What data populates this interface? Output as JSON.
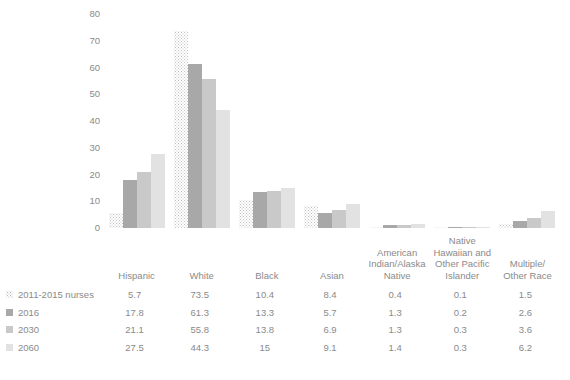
{
  "chart_data": {
    "type": "bar",
    "title": "",
    "xlabel": "",
    "ylabel": "",
    "ylim": [
      0,
      80
    ],
    "yticks": [
      0,
      10,
      20,
      30,
      40,
      50,
      60,
      70,
      80
    ],
    "grid": false,
    "legend_position": "bottom-left-table",
    "categories": [
      "Hispanic",
      "White",
      "Black",
      "Asian",
      "American Indian/Alaska Native",
      "Native Hawaiian and Other Pacific Islander",
      "Multiple/Other Race"
    ],
    "category_label_lines": [
      [
        "Hispanic"
      ],
      [
        "White"
      ],
      [
        "Black"
      ],
      [
        "Asian"
      ],
      [
        "American",
        "Indian/Alaska",
        "Native"
      ],
      [
        "Native",
        "Hawaiian and",
        "Other Pacific",
        "Islander"
      ],
      [
        "Multiple/",
        "Other Race"
      ]
    ],
    "series": [
      {
        "name": "2011-2015 nurses",
        "style": "dotted",
        "color": "#ffffff",
        "values": [
          5.7,
          73.5,
          10.4,
          8.4,
          0.4,
          0.1,
          1.5
        ],
        "value_labels": [
          "5.7",
          "73.5",
          "10.4",
          "8.4",
          "0.4",
          "0.1",
          "1.5"
        ]
      },
      {
        "name": "2016",
        "style": "solid",
        "color": "#a8a8a8",
        "values": [
          17.8,
          61.3,
          13.3,
          5.7,
          1.3,
          0.2,
          2.6
        ],
        "value_labels": [
          "17.8",
          "61.3",
          "13.3",
          "5.7",
          "1.3",
          "0.2",
          "2.6"
        ]
      },
      {
        "name": "2030",
        "style": "solid",
        "color": "#c9c9c9",
        "values": [
          21.1,
          55.8,
          13.8,
          6.9,
          1.3,
          0.3,
          3.6
        ],
        "value_labels": [
          "21.1",
          "55.8",
          "13.8",
          "6.9",
          "1.3",
          "0.3",
          "3.6"
        ]
      },
      {
        "name": "2060",
        "style": "solid",
        "color": "#e2e2e2",
        "values": [
          27.5,
          44.3,
          15.0,
          9.1,
          1.4,
          0.3,
          6.2
        ],
        "value_labels": [
          "27.5",
          "44.3",
          "15",
          "9.1",
          "1.4",
          "0.3",
          "6.2"
        ]
      }
    ]
  },
  "caption": ""
}
